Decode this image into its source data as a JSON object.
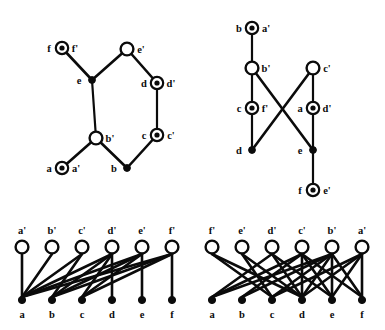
{
  "figure": {
    "background": "#ffffff",
    "ink": "#0b0b0b",
    "width": 385,
    "height": 330
  },
  "panels": [
    {
      "id": "top-left",
      "name": "panel-top-left",
      "type": "cycle-graph",
      "description": "Hexagonal cycle with a pendant vertex",
      "nodes": [
        {
          "id": "ff",
          "left_label": "f",
          "right_label": "f'",
          "style": "ring",
          "x": 62,
          "y": 48
        },
        {
          "id": "ee",
          "left_label": "e",
          "right_label": "",
          "style": "filled",
          "x": 92,
          "y": 80
        },
        {
          "id": "e1",
          "left_label": "",
          "right_label": "e'",
          "style": "open",
          "x": 127,
          "y": 49
        },
        {
          "id": "dd",
          "left_label": "d",
          "right_label": "d'",
          "style": "ring",
          "x": 157,
          "y": 83
        },
        {
          "id": "cc",
          "left_label": "c",
          "right_label": "c'",
          "style": "ring",
          "x": 157,
          "y": 135
        },
        {
          "id": "bb",
          "left_label": "",
          "right_label": "b'",
          "style": "open",
          "x": 96,
          "y": 138
        },
        {
          "id": "b1",
          "left_label": "b",
          "right_label": "",
          "style": "filled",
          "x": 127,
          "y": 168
        },
        {
          "id": "aa",
          "left_label": "a",
          "right_label": "a'",
          "style": "ring",
          "x": 62,
          "y": 168
        }
      ],
      "edges": [
        [
          "ff",
          "ee"
        ],
        [
          "ee",
          "e1"
        ],
        [
          "e1",
          "dd"
        ],
        [
          "dd",
          "cc"
        ],
        [
          "cc",
          "b1"
        ],
        [
          "b1",
          "bb"
        ],
        [
          "bb",
          "aa"
        ],
        [
          "bb",
          "ee"
        ]
      ]
    },
    {
      "id": "top-right",
      "name": "panel-top-right",
      "type": "crossing-graph",
      "description": "Two paths crossing in an X pattern",
      "nodes": [
        {
          "id": "ba",
          "left_label": "b",
          "right_label": "a'",
          "style": "ring",
          "x": 252,
          "y": 28
        },
        {
          "id": "bp",
          "left_label": "",
          "right_label": "b'",
          "style": "open",
          "x": 252,
          "y": 68
        },
        {
          "id": "cf",
          "left_label": "c",
          "right_label": "f'",
          "style": "ring",
          "x": 252,
          "y": 108
        },
        {
          "id": "d1",
          "left_label": "d",
          "right_label": "",
          "style": "filled",
          "x": 252,
          "y": 150
        },
        {
          "id": "cp",
          "left_label": "",
          "right_label": "c'",
          "style": "open",
          "x": 313,
          "y": 68
        },
        {
          "id": "ad",
          "left_label": "a",
          "right_label": "d'",
          "style": "ring",
          "x": 313,
          "y": 108
        },
        {
          "id": "e1",
          "left_label": "e",
          "right_label": "",
          "style": "filled",
          "x": 313,
          "y": 150
        },
        {
          "id": "fe",
          "left_label": "f",
          "right_label": "e'",
          "style": "ring",
          "x": 313,
          "y": 190
        }
      ],
      "edges": [
        [
          "ba",
          "bp"
        ],
        [
          "bp",
          "cf"
        ],
        [
          "cf",
          "d1"
        ],
        [
          "bp",
          "e1"
        ],
        [
          "cp",
          "ad"
        ],
        [
          "ad",
          "e1"
        ],
        [
          "e1",
          "fe"
        ],
        [
          "cp",
          "d1"
        ]
      ]
    },
    {
      "id": "bottom-left",
      "name": "panel-bottom-left",
      "type": "bipartite-graph",
      "description": "Bipartite graph, primed vertices on top, unprimed on bottom",
      "top_labels": [
        "a'",
        "b'",
        "c'",
        "d'",
        "e'",
        "f'"
      ],
      "bottom_labels": [
        "a",
        "b",
        "c",
        "d",
        "e",
        "f"
      ],
      "top_style": "open",
      "bottom_style": "filled",
      "edges": [
        [
          "a'",
          "a"
        ],
        [
          "b'",
          "a"
        ],
        [
          "c'",
          "a"
        ],
        [
          "c'",
          "b"
        ],
        [
          "d'",
          "a"
        ],
        [
          "d'",
          "b"
        ],
        [
          "d'",
          "c"
        ],
        [
          "d'",
          "d"
        ],
        [
          "e'",
          "a"
        ],
        [
          "e'",
          "b"
        ],
        [
          "e'",
          "c"
        ],
        [
          "e'",
          "e"
        ],
        [
          "f'",
          "a"
        ],
        [
          "f'",
          "b"
        ],
        [
          "f'",
          "c"
        ],
        [
          "f'",
          "f"
        ]
      ]
    },
    {
      "id": "bottom-right",
      "name": "panel-bottom-right",
      "type": "bipartite-graph",
      "description": "Bipartite graph, primed vertices reversed on top, unprimed on bottom",
      "top_labels": [
        "f'",
        "e'",
        "d'",
        "c'",
        "b'",
        "a'"
      ],
      "bottom_labels": [
        "a",
        "b",
        "c",
        "d",
        "e",
        "f"
      ],
      "top_style": "open",
      "bottom_style": "filled",
      "edges": [
        [
          "f'",
          "c"
        ],
        [
          "f'",
          "d"
        ],
        [
          "e'",
          "c"
        ],
        [
          "e'",
          "d"
        ],
        [
          "d'",
          "a"
        ],
        [
          "d'",
          "d"
        ],
        [
          "d'",
          "e"
        ],
        [
          "c'",
          "a"
        ],
        [
          "c'",
          "b"
        ],
        [
          "c'",
          "d"
        ],
        [
          "c'",
          "e"
        ],
        [
          "c'",
          "f"
        ],
        [
          "b'",
          "a"
        ],
        [
          "b'",
          "b"
        ],
        [
          "b'",
          "c"
        ],
        [
          "b'",
          "d"
        ],
        [
          "b'",
          "e"
        ],
        [
          "b'",
          "f"
        ],
        [
          "a'",
          "c"
        ],
        [
          "a'",
          "d"
        ],
        [
          "a'",
          "e"
        ],
        [
          "a'",
          "f"
        ]
      ]
    }
  ]
}
